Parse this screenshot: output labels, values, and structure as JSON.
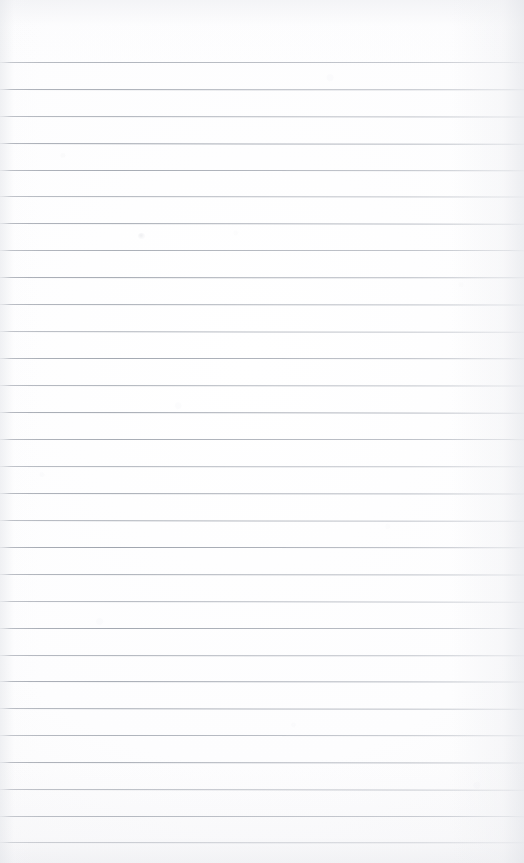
{
  "document": {
    "kind": "ruled-notepad-page",
    "title": "Blank ruled notepad page",
    "content_text": "",
    "page_width": 524,
    "page_height": 863,
    "is_blank": true
  },
  "paper": {
    "background_color": "#fdfdfd",
    "edge_shadow_color": "#e4e6ea",
    "texture_tint": "#d2d4da"
  },
  "ruling": {
    "line_color": "#9aa0aa",
    "line_thickness_px": 1,
    "line_spacing_px": 26.9,
    "first_line_y_px": 62,
    "last_line_y_px": 842,
    "left_inset_px": 0,
    "right_inset_px": 0,
    "top_margin_px": 62,
    "bottom_margin_px": 21,
    "line_count": 30,
    "has_vertical_margin_rule": false,
    "line_positions_y": [
      62,
      89,
      116,
      143,
      170,
      196,
      223,
      250,
      277,
      304,
      331,
      358,
      385,
      412,
      439,
      466,
      493,
      520,
      547,
      574,
      601,
      628,
      655,
      681,
      708,
      735,
      762,
      789,
      816,
      842
    ]
  },
  "artifacts": {
    "specks": [
      {
        "name": "scan-speck",
        "x": 138,
        "y": 233,
        "opacity": 0.45
      }
    ]
  }
}
